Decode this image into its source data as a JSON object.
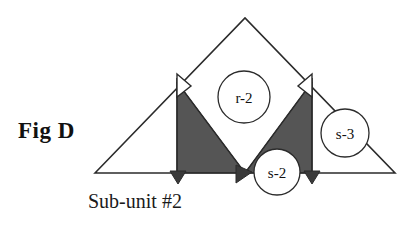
{
  "figure": {
    "label": "Fig D",
    "caption": "Sub-unit #2",
    "colors": {
      "stroke": "#2b2b2b",
      "fill_shaded": "#555555",
      "fill_light": "#ffffff",
      "background": "#ffffff",
      "text": "#111111"
    }
  },
  "diagram": {
    "outer_triangle": {
      "name": "outer-triangle",
      "points": "95,173 245,18 395,173"
    },
    "shaded_regions": [
      {
        "name": "left-shaded-triangle",
        "points": "177,82 177,173 245,173",
        "fill": "#555555"
      },
      {
        "name": "right-shaded-triangle",
        "points": "312,82 312,173 245,173",
        "fill": "#555555"
      }
    ],
    "chevron": {
      "name": "inner-white-chevron",
      "points": "177,82 245,173 312,82"
    },
    "verticals": [
      {
        "name": "left-vertical-line",
        "x": 177,
        "y1": 78,
        "y2": 174
      },
      {
        "name": "right-vertical-line",
        "x": 312,
        "y1": 78,
        "y2": 174
      }
    ],
    "flag_markers": [
      {
        "name": "left-flag-marker",
        "points": "177,74 191,86 177,97",
        "orientation": "right"
      },
      {
        "name": "right-flag-marker",
        "points": "312,74 298,86 312,97",
        "orientation": "left"
      }
    ],
    "base_arrows": [
      {
        "name": "base-arrow-left",
        "points": "170,171 186,171 178,184",
        "direction": "down"
      },
      {
        "name": "base-arrow-center",
        "points": "236,183 236,165 252,172",
        "direction": "up-right"
      },
      {
        "name": "base-arrow-right",
        "points": "304,171 320,171 312,184",
        "direction": "down"
      }
    ],
    "nodes": [
      {
        "name": "node-r-2",
        "label": "r-2",
        "cx": 244,
        "cy": 97,
        "r": 26
      },
      {
        "name": "node-s-3",
        "label": "s-3",
        "cx": 345,
        "cy": 133,
        "r": 24
      },
      {
        "name": "node-s-2",
        "label": "s-2",
        "cx": 277,
        "cy": 172,
        "r": 23
      }
    ]
  }
}
